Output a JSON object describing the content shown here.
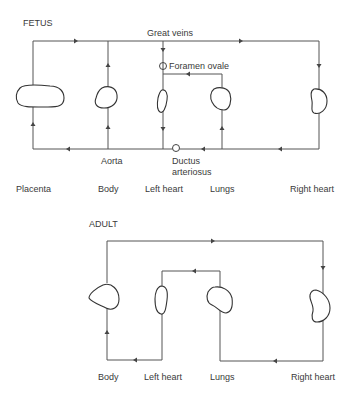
{
  "fetus": {
    "title": "FETUS",
    "labels": {
      "great_veins": "Great veins",
      "foramen_ovale": "Foramen ovale",
      "aorta": "Aorta",
      "ductus_line1": "Ductus",
      "ductus_line2": "arteriosus"
    },
    "organs": [
      "Placenta",
      "Body",
      "Left heart",
      "Lungs",
      "Right heart"
    ]
  },
  "adult": {
    "title": "ADULT",
    "organs": [
      "Body",
      "Left heart",
      "Lungs",
      "Right heart"
    ]
  },
  "colors": {
    "line": "#555555",
    "organ_outline": "#333333",
    "text": "#3a3a3a"
  }
}
